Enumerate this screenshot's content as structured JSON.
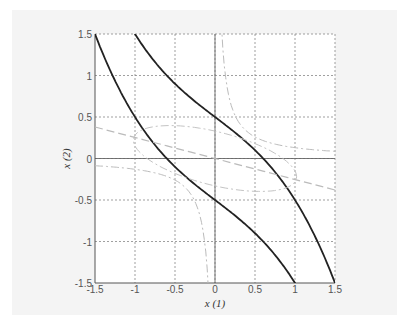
{
  "chart_data": {
    "type": "line",
    "title": "",
    "xlabel": "x (1)",
    "ylabel": "x (2)",
    "xlim": [
      -1.5,
      1.5
    ],
    "ylim": [
      -1.5,
      1.5
    ],
    "grid": true,
    "xticks": [
      "-1.5",
      "-1",
      "-0.5",
      "0",
      "0.5",
      "1",
      "1.5"
    ],
    "yticks": [
      "1.5",
      "1",
      "0.5",
      "0",
      "-0.5",
      "-1",
      "-1.5"
    ],
    "series": [
      {
        "name": "upper boundary (solid)",
        "style": "solid",
        "x": [
          -1.0,
          -0.5,
          0.0,
          0.5,
          1.0,
          1.5
        ],
        "y": [
          1.5,
          0.9,
          0.5,
          0.1,
          -0.5,
          -1.5
        ]
      },
      {
        "name": "lower boundary (solid)",
        "style": "solid",
        "x": [
          -1.5,
          -1.0,
          -0.5,
          0.0,
          0.5,
          1.0
        ],
        "y": [
          1.5,
          0.5,
          -0.1,
          -0.5,
          -0.9,
          -1.5
        ]
      },
      {
        "name": "line (dashed)",
        "style": "dashed",
        "x": [
          -1.5,
          0.0,
          1.5
        ],
        "y": [
          0.38,
          0.0,
          -0.38
        ]
      },
      {
        "name": "hyperbola (dash-dot)",
        "style": "dashdot",
        "x": [
          0.09,
          0.25,
          0.5,
          0.75
        ],
        "y": [
          1.5,
          0.52,
          0.26,
          0.17
        ]
      },
      {
        "name": "hyperbola mirror (dash-dot)",
        "style": "dashdot",
        "x": [
          -0.09,
          -0.25,
          -0.5,
          -0.75
        ],
        "y": [
          -1.5,
          -0.52,
          -0.26,
          -0.17
        ]
      },
      {
        "name": "ellipse (dash-dot)",
        "style": "dashdot",
        "center": [
          0,
          0
        ],
        "note": "closed rotated ellipse spanning approx x∈[-1,1], y∈[-0.5,0.5]"
      }
    ]
  }
}
